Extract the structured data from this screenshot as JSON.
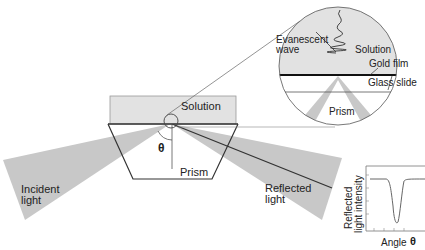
{
  "diagram": {
    "colors": {
      "beam": "#c8c8c8",
      "solution": "#e2e2e2",
      "line": "#333333",
      "gold_film": "#111111",
      "background": "#ffffff"
    },
    "main": {
      "solution_label": "Solution",
      "prism_label": "Prism",
      "angle_symbol": "θ",
      "incident_label_line1": "Incident",
      "incident_label_line2": "light",
      "reflected_label_line1": "Reflected",
      "reflected_label_line2": "light"
    },
    "inset_zoom": {
      "evanescent_line1": "Evanescent",
      "evanescent_line2": "wave",
      "solution_label": "Solution",
      "gold_film_label": "Gold film",
      "glass_slide_label": "Glass slide",
      "prism_label": "Prism"
    },
    "inset_plot": {
      "ylabel_line1": "Reflected",
      "ylabel_line2": "light intensity",
      "xlabel": "Angle",
      "xlabel_symbol": "θ",
      "curve_description": "flat high intensity with sharp dip at resonance angle"
    }
  }
}
